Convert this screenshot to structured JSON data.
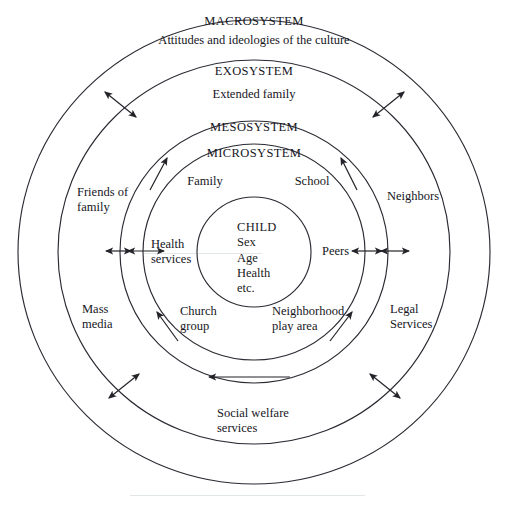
{
  "diagram": {
    "center": {
      "cx": 254,
      "cy": 252
    },
    "stroke_color": "#2a2a33",
    "background": "#ffffff",
    "rings": [
      {
        "name": "macrosystem",
        "rx": 236,
        "ry": 232,
        "label": "MACROSYSTEM",
        "sublabel": "Attitudes and ideologies of the culture"
      },
      {
        "name": "exosystem",
        "rx": 196,
        "ry": 192,
        "label": "EXOSYSTEM",
        "sublabel": "Extended family"
      },
      {
        "name": "mesosystem",
        "rx": 134,
        "ry": 131,
        "label": "MESOSYSTEM",
        "sublabel": ""
      },
      {
        "name": "microsystem",
        "rx": 111,
        "ry": 108,
        "label": "MICROSYSTEM",
        "sublabel": ""
      },
      {
        "name": "child-core",
        "rx": 57,
        "ry": 55,
        "label": "",
        "sublabel": ""
      }
    ],
    "system_labels": [
      {
        "id": "macrosystem-title",
        "text": "MACROSYSTEM",
        "x": 254,
        "y": 18
      },
      {
        "id": "macrosystem-subtitle",
        "text": "Attitudes and ideologies of the culture",
        "x": 254,
        "y": 36
      },
      {
        "id": "exosystem-title",
        "text": "EXOSYSTEM",
        "x": 254,
        "y": 66
      },
      {
        "id": "exosystem-subtitle",
        "text": "Extended family",
        "x": 254,
        "y": 89
      },
      {
        "id": "mesosystem-title",
        "text": "MESOSYSTEM",
        "x": 254,
        "y": 122
      },
      {
        "id": "microsystem-title",
        "text": "MICROSYSTEM",
        "x": 254,
        "y": 148
      }
    ],
    "child_core": {
      "heading": "CHILD",
      "attributes": [
        "Sex",
        "Age",
        "Health",
        "etc."
      ],
      "x": 237,
      "y": 222
    },
    "microsystem_nodes": [
      {
        "id": "family",
        "text": "Family",
        "x": 205,
        "y": 174,
        "align": "center"
      },
      {
        "id": "school",
        "text": "School",
        "x": 312,
        "y": 174,
        "align": "center"
      },
      {
        "id": "health-services",
        "text": "Health\nservices",
        "x": 152,
        "y": 238,
        "align": "left"
      },
      {
        "id": "peers",
        "text": "Peers",
        "x": 322,
        "y": 245,
        "align": "left"
      },
      {
        "id": "church-group",
        "text": "Church\ngroup",
        "x": 180,
        "y": 305,
        "align": "left"
      },
      {
        "id": "neighborhood-play-area",
        "text": "Neighborhood\nplay area",
        "x": 272,
        "y": 305,
        "align": "left"
      }
    ],
    "exosystem_nodes": [
      {
        "id": "friends-of-family",
        "text": "Friends of\nfamily",
        "x": 78,
        "y": 186,
        "align": "left"
      },
      {
        "id": "neighbors",
        "text": "Neighbors",
        "x": 388,
        "y": 190,
        "align": "left"
      },
      {
        "id": "mass-media",
        "text": "Mass\nmedia",
        "x": 82,
        "y": 303,
        "align": "left"
      },
      {
        "id": "legal-services",
        "text": "Legal\nServices",
        "x": 391,
        "y": 303,
        "align": "left"
      },
      {
        "id": "social-welfare-services",
        "text": "Social welfare\nservices",
        "x": 217,
        "y": 407,
        "align": "left"
      }
    ],
    "arrows": [
      {
        "id": "arrow-exo-upper-left",
        "type": "double",
        "x1": 105,
        "y1": 92,
        "x2": 136,
        "y2": 117
      },
      {
        "id": "arrow-exo-upper-right",
        "type": "double",
        "x1": 404,
        "y1": 92,
        "x2": 373,
        "y2": 117
      },
      {
        "id": "arrow-exo-lower-left",
        "type": "double",
        "x1": 109,
        "y1": 398,
        "x2": 139,
        "y2": 374
      },
      {
        "id": "arrow-exo-lower-right",
        "type": "double",
        "x1": 400,
        "y1": 398,
        "x2": 370,
        "y2": 374
      },
      {
        "id": "arrow-micro-left-inner",
        "type": "double",
        "x1": 128,
        "y1": 251,
        "x2": 164,
        "y2": 251
      },
      {
        "id": "arrow-micro-left-outer",
        "type": "double",
        "x1": 106,
        "y1": 251,
        "x2": 131,
        "y2": 251
      },
      {
        "id": "arrow-micro-right-inner",
        "type": "double",
        "x1": 352,
        "y1": 251,
        "x2": 382,
        "y2": 251
      },
      {
        "id": "arrow-micro-right-outer",
        "type": "double",
        "x1": 381,
        "y1": 251,
        "x2": 409,
        "y2": 251
      },
      {
        "id": "arrow-micro-top-left",
        "type": "single",
        "x1": 150,
        "y1": 190,
        "x2": 167,
        "y2": 158
      },
      {
        "id": "arrow-micro-top-right",
        "type": "single",
        "x1": 357,
        "y1": 190,
        "x2": 341,
        "y2": 158
      },
      {
        "id": "arrow-micro-bottom-left",
        "type": "single",
        "x1": 178,
        "y1": 341,
        "x2": 157,
        "y2": 312
      },
      {
        "id": "arrow-micro-bottom-right",
        "type": "single",
        "x1": 330,
        "y1": 341,
        "x2": 352,
        "y2": 312
      },
      {
        "id": "arrow-meso-bottom",
        "type": "single",
        "x1": 290,
        "y1": 377,
        "x2": 209,
        "y2": 377
      }
    ]
  }
}
